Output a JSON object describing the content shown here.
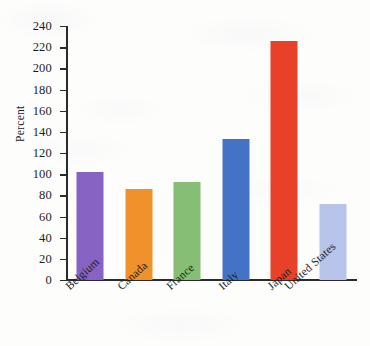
{
  "chart_data": {
    "type": "bar",
    "title": "",
    "subtitle": "",
    "xlabel": "",
    "ylabel": "Percent",
    "categories": [
      "Belgium",
      "Canada",
      "France",
      "Italy",
      "Japan",
      "United States"
    ],
    "values": [
      102,
      86,
      93,
      133,
      226,
      72
    ],
    "series": [
      {
        "name": "Percent",
        "values": [
          102,
          86,
          93,
          133,
          226,
          72
        ]
      }
    ],
    "bar_colors": [
      "#8763c4",
      "#f0922b",
      "#85be74",
      "#4472c4",
      "#e8412a",
      "#b8c4ea"
    ],
    "ylim": [
      0,
      240
    ],
    "y_ticks": [
      0,
      20,
      40,
      60,
      80,
      100,
      120,
      140,
      160,
      180,
      200,
      220,
      240
    ],
    "y_tick_labels": [
      "0",
      "20",
      "40",
      "60",
      "80",
      "100",
      "120",
      "140",
      "160",
      "180",
      "200",
      "220",
      "240"
    ],
    "grid": false,
    "legend": false,
    "legend_position": "none",
    "tick_direction": "out",
    "annotations": []
  },
  "figure": {
    "background_color": "#fdfdfc",
    "axis_color": "#2b2b2b",
    "text_color": "#1d1d1d"
  }
}
